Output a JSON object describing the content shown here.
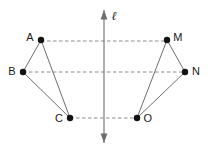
{
  "figure": {
    "canvas": {
      "width": 210,
      "height": 150,
      "background": "#ffffff"
    },
    "colors": {
      "point_fill": "#121212",
      "solid_edge": "#6e6e6e",
      "dashed_edge": "#8c8c8c",
      "axis_line": "#6e6e6e",
      "label_text": "#1a1a1a"
    },
    "axis": {
      "name": "mirror-line",
      "label": "ℓ",
      "label_x": 114,
      "label_y": 17,
      "x": 104,
      "y_top": 10,
      "y_bottom": 143,
      "arrow_top": true,
      "arrow_bottom": true
    },
    "points": [
      {
        "id": "A",
        "label": "A",
        "x": 41,
        "y": 40,
        "label_x": 30,
        "label_y": 38,
        "side": "left"
      },
      {
        "id": "B",
        "label": "B",
        "x": 23,
        "y": 72,
        "label_x": 12,
        "label_y": 72,
        "side": "left"
      },
      {
        "id": "C",
        "label": "C",
        "x": 70,
        "y": 118,
        "label_x": 59,
        "label_y": 119,
        "side": "left"
      },
      {
        "id": "M",
        "label": "M",
        "x": 167,
        "y": 40,
        "label_x": 178,
        "label_y": 38,
        "side": "right"
      },
      {
        "id": "N",
        "label": "N",
        "x": 185,
        "y": 72,
        "label_x": 196,
        "label_y": 72,
        "side": "right"
      },
      {
        "id": "O",
        "label": "O",
        "x": 137,
        "y": 118,
        "label_x": 148,
        "label_y": 119,
        "side": "right"
      }
    ],
    "solid_edges": [
      {
        "name": "edge-A-B",
        "x1": 41,
        "y1": 40,
        "x2": 23,
        "y2": 72
      },
      {
        "name": "edge-B-C",
        "x1": 23,
        "y1": 72,
        "x2": 70,
        "y2": 118
      },
      {
        "name": "edge-A-C",
        "x1": 41,
        "y1": 40,
        "x2": 70,
        "y2": 118
      },
      {
        "name": "edge-M-N",
        "x1": 167,
        "y1": 40,
        "x2": 185,
        "y2": 72
      },
      {
        "name": "edge-N-O",
        "x1": 185,
        "y1": 72,
        "x2": 137,
        "y2": 118
      },
      {
        "name": "edge-M-O",
        "x1": 167,
        "y1": 40,
        "x2": 137,
        "y2": 118
      }
    ],
    "dashed_connectors": [
      {
        "name": "connector-A-M",
        "x1": 41,
        "y1": 41,
        "x2": 167,
        "y2": 41
      },
      {
        "name": "connector-B-N",
        "x1": 23,
        "y1": 72,
        "x2": 185,
        "y2": 72
      },
      {
        "name": "connector-C-O",
        "x1": 70,
        "y1": 118,
        "x2": 137,
        "y2": 118
      }
    ],
    "point_radius": 3.2
  }
}
